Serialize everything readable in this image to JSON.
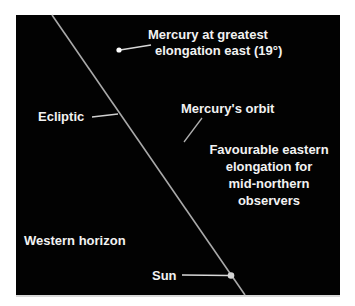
{
  "diagram": {
    "background_color": "#020202",
    "line_color": "#b8b8b8",
    "text_color": "#f2f2f2",
    "labels": {
      "mercury_elongation_line1": "Mercury at greatest",
      "mercury_elongation_line2": "elongation east (19°)",
      "ecliptic": "Ecliptic",
      "mercury_orbit": "Mercury's orbit",
      "favourable_line1": "Favourable eastern",
      "favourable_line2": "elongation for",
      "favourable_line3": "mid-northern",
      "favourable_line4": "observers",
      "western_horizon": "Western horizon",
      "sun": "Sun"
    },
    "objects": [
      {
        "name": "Mercury",
        "type": "point"
      },
      {
        "name": "Sun",
        "type": "point"
      }
    ]
  }
}
